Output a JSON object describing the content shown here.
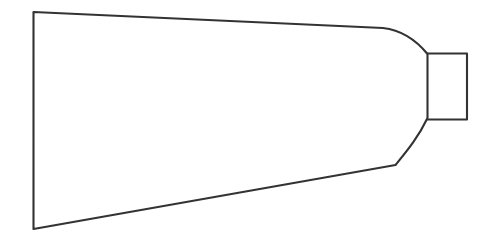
{
  "figure": {
    "style": "technical line drawing",
    "background_color": "#ffffff",
    "stroke_color": "#333333",
    "stroke_width": 2.1,
    "canvas": {
      "width": 492,
      "height": 242
    },
    "parts": [
      {
        "name": "body",
        "label": "tapered body outline",
        "path": "M 33.5 12 L 383 28 C 400 30 416 40 427.5 54 L 427.5 118 C 418 138 406 152 395.5 165 L 33.5 229 Z"
      },
      {
        "name": "neck",
        "label": "rectangular neck",
        "path": "M 427.5 53.5 L 467 53.5 L 467 119.5 L 427.5 119.5"
      }
    ],
    "vertices": {
      "base_top": [
        33.5,
        12
      ],
      "base_bottom": [
        33.5,
        229
      ],
      "top_bend": [
        383,
        28
      ],
      "bottom_bend": [
        395.5,
        165
      ],
      "neck_top_left": [
        427.5,
        53.5
      ],
      "neck_top_right": [
        467,
        53.5
      ],
      "neck_bottom_right": [
        467,
        119.5
      ],
      "neck_bottom_left": [
        427.5,
        119.5
      ]
    }
  }
}
